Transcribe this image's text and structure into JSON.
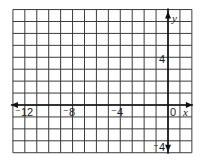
{
  "diagram": {
    "type": "coordinate-grid",
    "x_range": [
      -13,
      2
    ],
    "y_range": [
      -4,
      8
    ],
    "grid_step": 1,
    "axis_x_label": "x",
    "axis_y_label": "y",
    "x_tick_labels": [
      {
        "value": -12,
        "text": "⁻12"
      },
      {
        "value": -8,
        "text": "⁻8"
      },
      {
        "value": -4,
        "text": "⁻4"
      },
      {
        "value": 0,
        "text": "0"
      }
    ],
    "y_tick_labels": [
      {
        "value": 4,
        "text": "4"
      },
      {
        "value": -4,
        "text": "⁻4"
      }
    ],
    "colors": {
      "grid": "#3a3a3a",
      "axis": "#111111",
      "background": "#ffffff",
      "text": "#1a1a1a"
    }
  },
  "labels": {
    "x_axis": "x",
    "y_axis": "y",
    "x_neg12": "⁻12",
    "x_neg8": "⁻8",
    "x_neg4": "⁻4",
    "x_zero": "0",
    "y_pos4": "4",
    "y_neg4": "⁻4"
  }
}
